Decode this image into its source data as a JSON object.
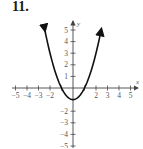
{
  "problem": {
    "number": "11."
  },
  "chart_data": {
    "type": "line",
    "title": "",
    "function": "y = x^2 - 1",
    "xlabel": "x",
    "ylabel": "y",
    "xlim": [
      -5,
      5
    ],
    "ylim": [
      -5,
      5
    ],
    "grid": false,
    "x_tick_labels": [
      "-5",
      "-4",
      "-3",
      "-2",
      "2",
      "3",
      "4",
      "5"
    ],
    "y_tick_labels": [
      "5",
      "4",
      "3",
      "2",
      "1",
      "-2",
      "-3",
      "-4",
      "-5"
    ],
    "series": [
      {
        "name": "parabola",
        "x": [
          -2.45,
          -2,
          -1.5,
          -1,
          -0.5,
          0,
          0.5,
          1,
          1.5,
          2,
          2.45
        ],
        "y": [
          5.0,
          3,
          1.25,
          0,
          -0.75,
          -1,
          -0.75,
          0,
          1.25,
          3,
          5.0
        ]
      }
    ],
    "vertex": [
      0,
      -1
    ],
    "x_intercepts": [
      -1,
      1
    ],
    "ends_with_arrows": true,
    "colors": {
      "curve": "#111111",
      "axes": "#444444",
      "labels": "#555555"
    }
  }
}
